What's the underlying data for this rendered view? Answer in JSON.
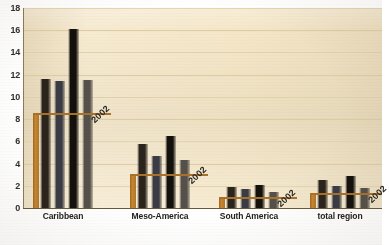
{
  "chart_data": {
    "type": "bar",
    "title": "",
    "subtitle": "",
    "xlabel": "",
    "ylabel": "",
    "ylim": [
      0,
      18
    ],
    "ytick_step": 2,
    "yticks": [
      "0",
      "2",
      "4",
      "6",
      "8",
      "10",
      "12",
      "14",
      "16",
      "18"
    ],
    "grid": true,
    "legend_position": "none",
    "categories": [
      "Caribbean",
      "Meso-America",
      "South America",
      "total region"
    ],
    "annotations": [
      "2002",
      "2002",
      "2002",
      "2002"
    ],
    "reference_series": {
      "name": "2002",
      "color": "#b0762a",
      "values": [
        8.5,
        3.0,
        0.9,
        1.3
      ]
    },
    "series": [
      {
        "name": "series-1",
        "color": "#2b241c",
        "values": [
          11.6,
          5.8,
          1.9,
          2.5
        ]
      },
      {
        "name": "series-2",
        "color": "#3a3b44",
        "values": [
          11.4,
          4.7,
          1.7,
          2.0
        ]
      },
      {
        "name": "series-3",
        "color": "#14110d",
        "values": [
          16.1,
          6.5,
          2.1,
          2.9
        ]
      },
      {
        "name": "series-4",
        "color": "#55504a",
        "values": [
          11.5,
          4.3,
          1.4,
          1.8
        ]
      }
    ]
  },
  "colors": {
    "background": "#f4e5c4",
    "gridline": "#ddc9a0",
    "axis": "#6a5a3c",
    "reference": "#b0762a",
    "text": "#25221e"
  }
}
